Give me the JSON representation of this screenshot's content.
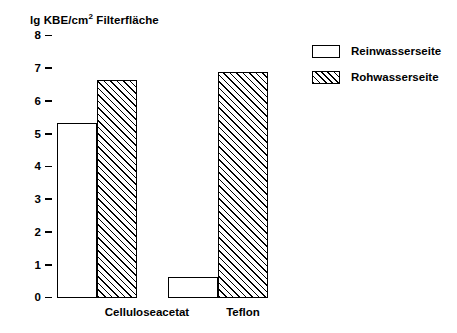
{
  "chart_data": {
    "type": "bar",
    "title": "",
    "ylabel_parts": {
      "prefix": "lg KBE/cm",
      "superscript": "2",
      "suffix": " Filterfläche"
    },
    "ylabel": "lg KBE/cm2 Filterfläche",
    "xlabel": "",
    "categories": [
      "Celluloseacetat",
      "Teflon"
    ],
    "series": [
      {
        "name": "Reinwasserseite",
        "fill": "solid-white",
        "values": [
          5.35,
          0.65
        ]
      },
      {
        "name": "Rohwasserseite",
        "fill": "diagonal-hatch",
        "values": [
          6.65,
          6.9
        ]
      }
    ],
    "ylim": [
      0,
      8
    ],
    "yticks": [
      "0",
      "1",
      "2",
      "3",
      "4",
      "5",
      "6",
      "7",
      "8"
    ],
    "ytick_values": [
      0,
      1,
      2,
      3,
      4,
      5,
      6,
      7,
      8
    ],
    "grid": false,
    "legend_position": "top-right",
    "colors": {
      "line": "#000000",
      "background": "#ffffff",
      "bar_fill": "#ffffff"
    }
  },
  "legend": {
    "items": [
      {
        "label": "Reinwasserseite",
        "pattern": "empty"
      },
      {
        "label": "Rohwasserseite",
        "pattern": "hatched"
      }
    ]
  }
}
